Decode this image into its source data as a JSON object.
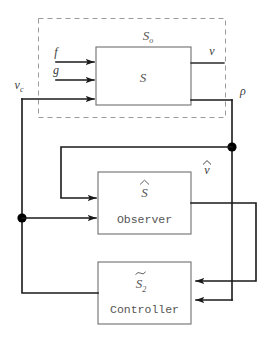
{
  "diagram": {
    "colors": {
      "wire": "#1a1a1a",
      "block_border": "#6f6f6f",
      "dashed_border": "#9a9a9a",
      "text": "#555555",
      "background": "#ffffff"
    },
    "outer_group": {
      "label": "S",
      "label_sub": "o",
      "style": "dashed"
    },
    "blocks": [
      {
        "id": "plant",
        "symbol": "S",
        "symbol_sub": "",
        "accent": "none",
        "caption": ""
      },
      {
        "id": "observer",
        "symbol": "S",
        "symbol_sub": "",
        "accent": "hat",
        "caption": "Observer"
      },
      {
        "id": "controller",
        "symbol": "S",
        "symbol_sub": "2",
        "accent": "tilde",
        "caption": "Controller"
      }
    ],
    "signals": [
      {
        "id": "f",
        "label": "f",
        "sub": "",
        "accent": "none"
      },
      {
        "id": "g",
        "label": "g",
        "sub": "",
        "accent": "none"
      },
      {
        "id": "vc",
        "label": "v",
        "sub": "c",
        "accent": "none"
      },
      {
        "id": "v",
        "label": "v",
        "sub": "",
        "accent": "none"
      },
      {
        "id": "rho",
        "label": "ρ",
        "sub": "",
        "accent": "none"
      },
      {
        "id": "vhat",
        "label": "v",
        "sub": "",
        "accent": "hat"
      }
    ]
  }
}
